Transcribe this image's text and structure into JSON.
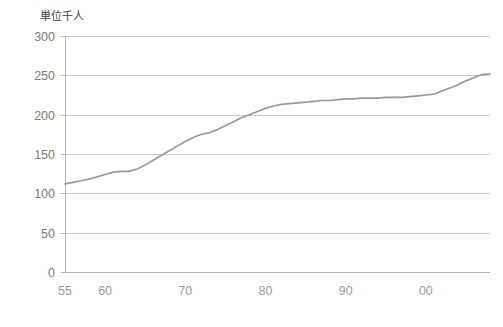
{
  "chart_data": {
    "type": "line",
    "title": "",
    "subtitle": "",
    "unit_label": "単位千人",
    "xlabel": "",
    "ylabel": "",
    "ylim": [
      0,
      300
    ],
    "xlim": [
      1955,
      2008
    ],
    "grid": "horizontal",
    "legend": "none",
    "y_ticks": [
      "0",
      "50",
      "100",
      "150",
      "200",
      "250",
      "300"
    ],
    "y_tick_values": [
      0,
      50,
      100,
      150,
      200,
      250,
      300
    ],
    "x_ticks": [
      "55",
      "60",
      "70",
      "80",
      "90",
      "00"
    ],
    "x_tick_values": [
      1955,
      1960,
      1970,
      1980,
      1990,
      2000
    ],
    "series": [
      {
        "name": "単位千人",
        "color": "#999999",
        "x": [
          1955,
          1956,
          1957,
          1958,
          1959,
          1960,
          1961,
          1962,
          1963,
          1964,
          1965,
          1966,
          1967,
          1968,
          1969,
          1970,
          1971,
          1972,
          1973,
          1974,
          1975,
          1976,
          1977,
          1978,
          1979,
          1980,
          1981,
          1982,
          1983,
          1984,
          1985,
          1986,
          1987,
          1988,
          1989,
          1990,
          1991,
          1992,
          1993,
          1994,
          1995,
          1996,
          1997,
          1998,
          1999,
          2000,
          2001,
          2002,
          2003,
          2004,
          2005,
          2006,
          2007,
          2008
        ],
        "values": [
          112,
          114,
          116,
          118,
          121,
          124,
          127,
          128,
          128,
          131,
          136,
          142,
          148,
          154,
          160,
          166,
          171,
          175,
          177,
          181,
          186,
          191,
          196,
          200,
          204,
          208,
          211,
          213,
          214,
          215,
          216,
          217,
          218,
          218,
          219,
          220,
          220,
          221,
          221,
          221,
          222,
          222,
          222,
          223,
          224,
          225,
          226,
          230,
          234,
          238,
          243,
          247,
          251,
          252
        ]
      }
    ]
  },
  "axis_geometry": {
    "plot_left": 65,
    "plot_right": 490,
    "plot_top": 36,
    "plot_bottom": 272
  }
}
